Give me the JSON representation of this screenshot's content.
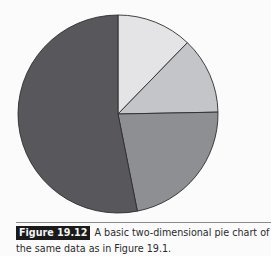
{
  "chart_data": {
    "type": "pie",
    "title": "",
    "categories": [
      "Slice A",
      "Slice B",
      "Slice C",
      "Slice D"
    ],
    "values": [
      12.2,
      12.5,
      22.2,
      53.1
    ],
    "colors": [
      "#e4e4e6",
      "#c4c5c8",
      "#8e8f93",
      "#58585c"
    ],
    "start_angle_deg": 0,
    "direction": "clockwise",
    "legend": "none",
    "data_labels": "none",
    "geometry": {
      "cx": 118,
      "cy": 114,
      "rx": 100,
      "ry": 99
    }
  },
  "caption": {
    "label": "Figure 19.12",
    "text": "A basic two-dimensional pie chart of the same data as in Figure 19.1."
  }
}
